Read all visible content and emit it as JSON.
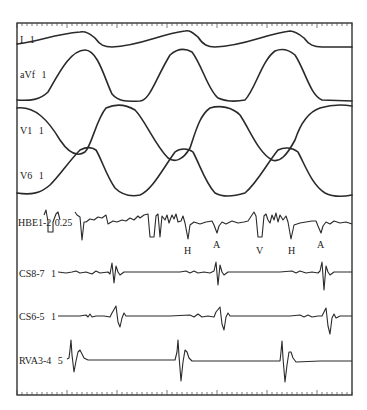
{
  "figure": {
    "type": "intracardiac electrogram tracing",
    "channels": [
      {
        "name": "I",
        "gain": "1"
      },
      {
        "name": "aVf",
        "gain": "1"
      },
      {
        "name": "V1",
        "gain": "1"
      },
      {
        "name": "V6",
        "gain": "1"
      },
      {
        "name": "HBE1-2",
        "gain": "0.25"
      },
      {
        "name": "CS8-7",
        "gain": "1"
      },
      {
        "name": "CS6-5",
        "gain": "1"
      },
      {
        "name": "RVA3-4",
        "gain": "5"
      }
    ],
    "his_markers": [
      {
        "label": "H",
        "x": 188
      },
      {
        "label": "A",
        "x": 217
      },
      {
        "label": "V",
        "x": 260
      },
      {
        "label": "H",
        "x": 292
      },
      {
        "label": "A",
        "x": 321
      }
    ],
    "colors": {
      "trace": "#2a2a2a",
      "background": "#ffffff",
      "frame": "#222222"
    }
  }
}
